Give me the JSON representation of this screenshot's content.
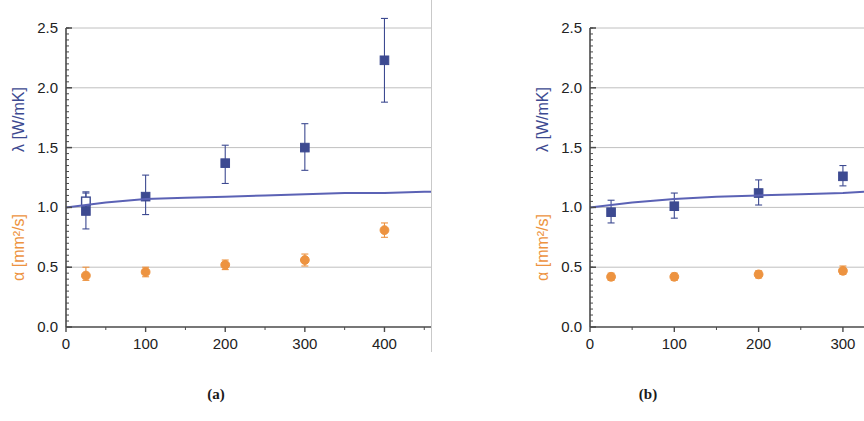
{
  "figure": {
    "caption_a": "(a)",
    "caption_b": "(b)",
    "axis_color": "#4a4a4a",
    "grid_color": "#b9b9b9",
    "lambda_color": "#3d4a91",
    "alpha_color": "#ed9340"
  },
  "chart_data": [
    {
      "type": "scatter",
      "panel": "(a)",
      "title": "",
      "xlabel": "T [°C]",
      "ylabel_alpha": "α [mm²/s]",
      "ylabel_lambda": "λ [W/mK]",
      "xlim": [
        0,
        520
      ],
      "ylim": [
        0.0,
        2.5
      ],
      "xticks": [
        0,
        100,
        200,
        300,
        400,
        500
      ],
      "xticklabels": [
        "0",
        "100",
        "200",
        "300",
        "400",
        "500"
      ],
      "yticks": [
        0.0,
        0.5,
        1.0,
        1.5,
        2.0,
        2.5
      ],
      "yticklabels": [
        "0.0",
        "0.5",
        "1.0",
        "1.5",
        "2.0",
        "2.5"
      ],
      "grid": true,
      "legend": "none",
      "series": [
        {
          "name": "λ [W/mK]",
          "marker": "filled-square",
          "color": "#3d4a91",
          "x": [
            25,
            100,
            200,
            300,
            400,
            500
          ],
          "values": [
            0.97,
            1.09,
            1.37,
            1.5,
            2.23,
            2.11
          ],
          "yerr_low": [
            0.82,
            0.94,
            1.2,
            1.31,
            1.88,
            1.81
          ],
          "yerr_high": [
            1.12,
            1.27,
            1.52,
            1.7,
            2.58,
            2.42
          ]
        },
        {
          "name": "λ [W/mK] (open)",
          "marker": "open-square",
          "color": "#3d4a91",
          "x": [
            25
          ],
          "values": [
            1.05
          ],
          "yerr_low": [
            0.98
          ],
          "yerr_high": [
            1.13
          ]
        },
        {
          "name": "α [mm²/s]",
          "marker": "filled-circle",
          "color": "#ed9340",
          "x": [
            25,
            100,
            200,
            300,
            400,
            500
          ],
          "values": [
            0.43,
            0.46,
            0.52,
            0.56,
            0.81,
            0.74
          ],
          "yerr_low": [
            0.39,
            0.42,
            0.48,
            0.51,
            0.75,
            0.68
          ],
          "yerr_high": [
            0.5,
            0.5,
            0.56,
            0.61,
            0.87,
            0.81
          ]
        },
        {
          "name": "fit curve",
          "marker": "line",
          "color": "#5b62b5",
          "x": [
            0,
            25,
            50,
            100,
            150,
            200,
            250,
            300,
            350,
            400,
            450,
            500,
            520
          ],
          "values": [
            1.0,
            1.02,
            1.04,
            1.07,
            1.08,
            1.09,
            1.1,
            1.11,
            1.12,
            1.12,
            1.13,
            1.13,
            1.13
          ]
        }
      ]
    },
    {
      "type": "scatter",
      "panel": "(b)",
      "title": "",
      "xlabel": "T [°C]",
      "ylabel_alpha": "α [mm²/s]",
      "ylabel_lambda": "λ [W/mK]",
      "xlim": [
        0,
        325
      ],
      "ylim": [
        0.0,
        2.5
      ],
      "xticks": [
        0,
        100,
        200,
        300
      ],
      "xticklabels": [
        "0",
        "100",
        "200",
        "300"
      ],
      "yticks": [
        0.0,
        0.5,
        1.0,
        1.5,
        2.0,
        2.5
      ],
      "yticklabels": [
        "0.0",
        "0.5",
        "1.0",
        "1.5",
        "2.0",
        "2.5"
      ],
      "grid": true,
      "legend": "none",
      "series": [
        {
          "name": "λ [W/mK]",
          "marker": "filled-square",
          "color": "#3d4a91",
          "x": [
            25,
            100,
            200,
            300
          ],
          "values": [
            0.96,
            1.01,
            1.12,
            1.26
          ],
          "yerr_low": [
            0.87,
            0.91,
            1.02,
            1.18
          ],
          "yerr_high": [
            1.06,
            1.12,
            1.23,
            1.35
          ]
        },
        {
          "name": "α [mm²/s]",
          "marker": "filled-circle",
          "color": "#ed9340",
          "x": [
            25,
            100,
            200,
            300
          ],
          "values": [
            0.42,
            0.42,
            0.44,
            0.47
          ],
          "yerr_low": [
            0.39,
            0.39,
            0.41,
            0.44
          ],
          "yerr_high": [
            0.45,
            0.45,
            0.47,
            0.51
          ]
        },
        {
          "name": "fit curve",
          "marker": "line",
          "color": "#5b62b5",
          "x": [
            0,
            25,
            50,
            100,
            150,
            200,
            250,
            300,
            325
          ],
          "values": [
            1.0,
            1.02,
            1.04,
            1.07,
            1.09,
            1.1,
            1.11,
            1.12,
            1.13
          ]
        }
      ]
    }
  ]
}
